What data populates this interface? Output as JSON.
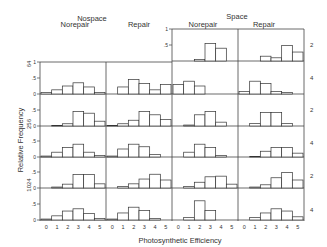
{
  "chart_data": {
    "type": "bar",
    "title": "",
    "xlabel": "Photosynthetic Efficiency",
    "ylabel": "Relative Frequency",
    "x_categories": [
      "0",
      "1",
      "2",
      "3",
      "4",
      "5"
    ],
    "ylim": [
      0,
      1
    ],
    "y_ticks": [
      "0",
      ".5",
      "1"
    ],
    "grid": false,
    "group_labels": [
      {
        "name": "Nospace",
        "columns": [
          "Norepair",
          "Repair"
        ]
      },
      {
        "name": "Space",
        "columns": [
          "Norepair",
          "Repair"
        ]
      }
    ],
    "row_labels_left": [
      "64",
      "256",
      "1024"
    ],
    "row_labels_right": [
      "2",
      "4",
      "2",
      "4",
      "2",
      "4"
    ],
    "panels": {
      "nospace_norepair": [
        [
          0.05,
          0.13,
          0.25,
          0.35,
          0.22,
          0.05
        ],
        [
          0.0,
          0.02,
          0.07,
          0.45,
          0.4,
          0.15
        ],
        [
          0.03,
          0.15,
          0.3,
          0.4,
          0.15,
          0.05
        ],
        [
          0.0,
          0.03,
          0.12,
          0.42,
          0.42,
          0.13
        ],
        [
          0.03,
          0.13,
          0.28,
          0.35,
          0.2,
          0.05
        ]
      ],
      "nospace_repair": [
        [
          0.0,
          0.22,
          0.45,
          0.33,
          0.13,
          0.3
        ],
        [
          0.02,
          0.07,
          0.18,
          0.45,
          0.35,
          0.2
        ],
        [
          0.03,
          0.25,
          0.4,
          0.32,
          0.08,
          0.0
        ],
        [
          0.0,
          0.05,
          0.13,
          0.28,
          0.43,
          0.25
        ],
        [
          0.03,
          0.22,
          0.4,
          0.3,
          0.05,
          0.0
        ]
      ],
      "space_norepair": [
        [
          0.0,
          0.0,
          0.05,
          0.55,
          0.4,
          0.0
        ],
        [
          0.3,
          0.4,
          0.25,
          0.0,
          0.0,
          0.0
        ],
        [
          0.0,
          0.03,
          0.35,
          0.45,
          0.12,
          0.0
        ],
        [
          0.0,
          0.15,
          0.4,
          0.3,
          0.05,
          0.0
        ],
        [
          0.0,
          0.05,
          0.18,
          0.35,
          0.37,
          0.12
        ],
        [
          0.0,
          0.08,
          0.6,
          0.3,
          0.0,
          0.0
        ]
      ],
      "space_repair": [
        [
          0.0,
          0.0,
          0.15,
          0.1,
          0.48,
          0.28
        ],
        [
          0.08,
          0.4,
          0.33,
          0.08,
          0.05,
          0.0
        ],
        [
          0.0,
          0.08,
          0.42,
          0.42,
          0.08,
          0.0
        ],
        [
          0.0,
          0.02,
          0.18,
          0.3,
          0.3,
          0.12
        ],
        [
          0.0,
          0.03,
          0.1,
          0.32,
          0.48,
          0.25
        ],
        [
          0.0,
          0.08,
          0.22,
          0.35,
          0.28,
          0.1
        ]
      ]
    }
  },
  "labels": {
    "xlabel": "Photosynthetic Efficiency",
    "ylabel": "Relative Frequency",
    "nospace": "Nospace",
    "space": "Space",
    "norepair": "Norepair",
    "repair": "Repair"
  }
}
